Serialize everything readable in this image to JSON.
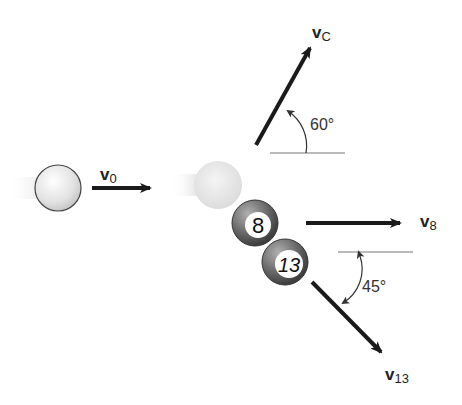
{
  "diagram": {
    "balls": [
      {
        "id": "cue-initial",
        "label": "",
        "role": "cue ball before impact"
      },
      {
        "id": "cue-impact",
        "label": "",
        "role": "cue ball at impact"
      },
      {
        "id": "ball-8",
        "label": "8"
      },
      {
        "id": "ball-13",
        "label": "13"
      }
    ],
    "vectors": {
      "v0": {
        "symbol": "v",
        "subscript": "0"
      },
      "vC": {
        "symbol": "v",
        "subscript": "C"
      },
      "v8": {
        "symbol": "v",
        "subscript": "8"
      },
      "v13": {
        "symbol": "v",
        "subscript": "13"
      }
    },
    "angles": {
      "vc_angle": "60°",
      "v13_angle": "45°"
    },
    "colors": {
      "arrow": "#1a1a1a",
      "reference_line": "#777777",
      "cue_ball": "#e6e6e6",
      "numbered_ball": "#6e6e6e"
    }
  }
}
